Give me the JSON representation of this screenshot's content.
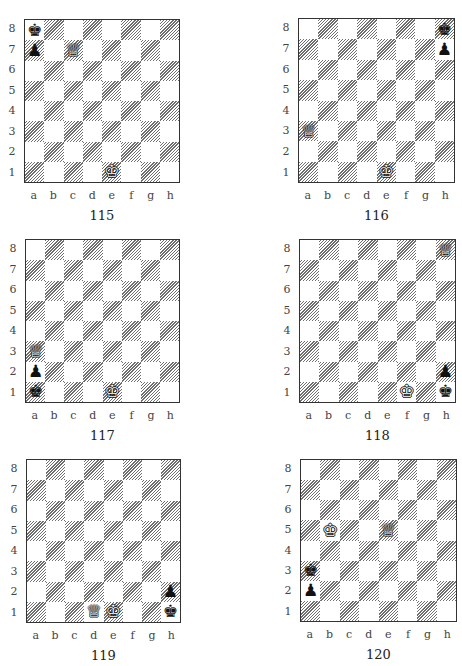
{
  "ranks": [
    "8",
    "7",
    "6",
    "5",
    "4",
    "3",
    "2",
    "1"
  ],
  "files": [
    "a",
    "b",
    "c",
    "d",
    "e",
    "f",
    "g",
    "h"
  ],
  "piece_glyphs": {
    "K": "♔",
    "Q": "♕",
    "P": "♙",
    "k": "♚",
    "q": "♛",
    "p": "♟"
  },
  "diagrams": [
    {
      "number": "115",
      "pieces": [
        {
          "square": "a8",
          "piece": "k",
          "name": "black-king"
        },
        {
          "square": "a7",
          "piece": "p",
          "name": "black-pawn"
        },
        {
          "square": "c7",
          "piece": "Q",
          "name": "white-queen"
        },
        {
          "square": "e1",
          "piece": "K",
          "name": "white-king"
        }
      ]
    },
    {
      "number": "116",
      "pieces": [
        {
          "square": "h8",
          "piece": "k",
          "name": "black-king"
        },
        {
          "square": "h7",
          "piece": "p",
          "name": "black-pawn"
        },
        {
          "square": "a3",
          "piece": "Q",
          "name": "white-queen"
        },
        {
          "square": "e1",
          "piece": "K",
          "name": "white-king"
        }
      ]
    },
    {
      "number": "117",
      "pieces": [
        {
          "square": "a3",
          "piece": "Q",
          "name": "white-queen"
        },
        {
          "square": "a2",
          "piece": "p",
          "name": "black-pawn"
        },
        {
          "square": "a1",
          "piece": "k",
          "name": "black-king"
        },
        {
          "square": "e1",
          "piece": "K",
          "name": "white-king"
        }
      ]
    },
    {
      "number": "118",
      "pieces": [
        {
          "square": "h8",
          "piece": "Q",
          "name": "white-queen"
        },
        {
          "square": "h2",
          "piece": "p",
          "name": "black-pawn"
        },
        {
          "square": "f1",
          "piece": "K",
          "name": "white-king"
        },
        {
          "square": "h1",
          "piece": "k",
          "name": "black-king"
        }
      ]
    },
    {
      "number": "119",
      "pieces": [
        {
          "square": "h2",
          "piece": "p",
          "name": "black-pawn"
        },
        {
          "square": "d1",
          "piece": "Q",
          "name": "white-queen"
        },
        {
          "square": "e1",
          "piece": "K",
          "name": "white-king"
        },
        {
          "square": "h1",
          "piece": "k",
          "name": "black-king"
        }
      ]
    },
    {
      "number": "120",
      "pieces": [
        {
          "square": "b5",
          "piece": "K",
          "name": "white-king"
        },
        {
          "square": "e5",
          "piece": "Q",
          "name": "white-queen"
        },
        {
          "square": "a3",
          "piece": "k",
          "name": "black-king"
        },
        {
          "square": "a2",
          "piece": "p",
          "name": "black-pawn"
        }
      ]
    }
  ]
}
